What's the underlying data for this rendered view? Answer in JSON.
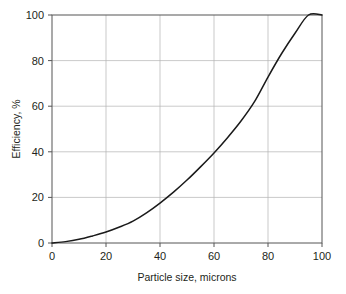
{
  "chart_data": {
    "type": "line",
    "title": "",
    "xlabel": "Particle size, microns",
    "ylabel": "Efficiency, %",
    "xlim": [
      0,
      100
    ],
    "ylim": [
      0,
      100
    ],
    "xticks": [
      0,
      20,
      40,
      60,
      80,
      100
    ],
    "yticks": [
      0,
      20,
      40,
      60,
      80,
      100
    ],
    "xtick_labels": [
      "0",
      "20",
      "40",
      "60",
      "80",
      "100"
    ],
    "ytick_labels": [
      "0",
      "20",
      "40",
      "60",
      "80",
      "100"
    ],
    "grid": true,
    "legend": null,
    "series": [
      {
        "name": "Collection efficiency",
        "color": "#1a1a1a",
        "x": [
          0,
          5,
          10,
          15,
          20,
          25,
          30,
          35,
          40,
          45,
          50,
          55,
          60,
          65,
          70,
          75,
          80,
          85,
          90,
          95,
          100
        ],
        "y": [
          0.0,
          0.6,
          1.6,
          3.1,
          4.8,
          7.0,
          9.6,
          13.2,
          17.5,
          22.3,
          27.6,
          33.4,
          39.5,
          46.2,
          53.5,
          62.0,
          72.8,
          83.0,
          92.0,
          100.0,
          100.0
        ]
      }
    ]
  },
  "style": {
    "background": "#ffffff",
    "grid_color": "#b3b3b3",
    "axis_color": "#555555",
    "curve_color": "#1a1a1a",
    "text_color": "#231f20"
  }
}
